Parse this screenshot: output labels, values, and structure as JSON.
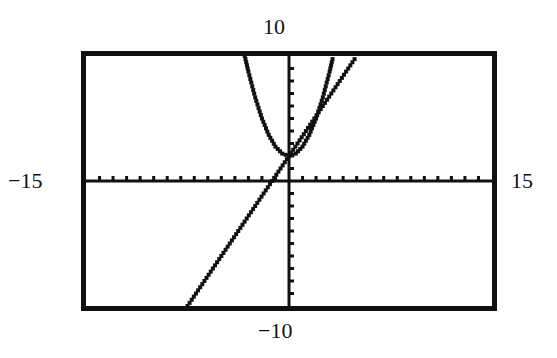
{
  "chart_data": {
    "type": "line",
    "title": "",
    "xlabel": "",
    "ylabel": "",
    "window": {
      "xmin": -15,
      "xmax": 15,
      "ymin": -10,
      "ymax": 10,
      "xscl": 1,
      "yscl": 1
    },
    "xlim": [
      -15,
      15
    ],
    "ylim": [
      -10,
      10
    ],
    "grid": false,
    "axes_visible": true,
    "tick_labels": {
      "top": "10",
      "bottom": "−10",
      "left": "−15",
      "right": "15"
    },
    "series": [
      {
        "name": "parabola",
        "style": "pixel-dotted",
        "approx_equation": "y = 0.75x^2 + 2",
        "x": [
          -3.27,
          -3,
          -2.5,
          -2,
          -1.5,
          -1,
          -0.5,
          0,
          0.5,
          1,
          1.5,
          2,
          2.5,
          3,
          3.27
        ],
        "y": [
          10,
          8.75,
          6.69,
          5,
          3.69,
          2.75,
          2.19,
          2,
          2.19,
          2.75,
          3.69,
          5,
          6.69,
          8.75,
          10
        ]
      },
      {
        "name": "line",
        "style": "pixel-dotted",
        "approx_equation": "y = 1.6x + 2",
        "x": [
          -7.5,
          -5,
          -2.5,
          0,
          2.5,
          5
        ],
        "y": [
          -10,
          -6,
          -2,
          2,
          6,
          10
        ]
      }
    ]
  },
  "colors": {
    "ink": "#111111",
    "background": "#ffffff"
  }
}
